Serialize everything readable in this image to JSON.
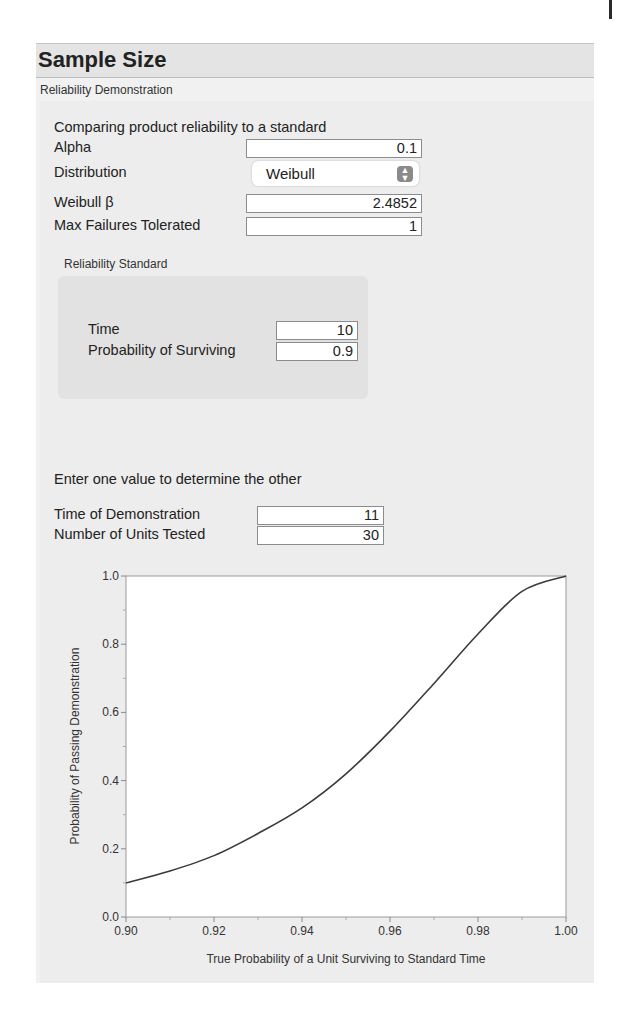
{
  "header": {
    "title": "Sample Size",
    "subtitle": "Reliability Demonstration"
  },
  "form": {
    "section_label": "Comparing product reliability to a standard",
    "alpha": {
      "label": "Alpha",
      "value": "0.1"
    },
    "distribution": {
      "label": "Distribution",
      "value": "Weibull",
      "icon": "updown-chevron-icon"
    },
    "weibull_beta": {
      "label": "Weibull β",
      "value": "2.4852"
    },
    "max_failures": {
      "label": "Max Failures Tolerated",
      "value": "1"
    }
  },
  "standard": {
    "title": "Reliability Standard",
    "time": {
      "label": "Time",
      "value": "10"
    },
    "prob_surviving": {
      "label": "Probability of Surviving",
      "value": "0.9"
    }
  },
  "determine": {
    "label": "Enter one value to determine the other",
    "time_demo": {
      "label": "Time of Demonstration",
      "value": "11"
    },
    "units_tested": {
      "label": "Number of Units Tested",
      "value": "30"
    }
  },
  "chart_data": {
    "type": "line",
    "title": "",
    "xlabel": "True Probability of a Unit Surviving to Standard Time",
    "ylabel": "Probability of Passing Demonstration",
    "xlim": [
      0.9,
      1.0
    ],
    "ylim": [
      0.0,
      1.0
    ],
    "x_ticks": [
      "0.90",
      "0.92",
      "0.94",
      "0.96",
      "0.98",
      "1.00"
    ],
    "y_ticks": [
      "0.0",
      "0.2",
      "0.4",
      "0.6",
      "0.8",
      "1.0"
    ],
    "grid": false,
    "legend": null,
    "series": [
      {
        "name": "Probability of Passing",
        "x": [
          0.9,
          0.91,
          0.92,
          0.93,
          0.94,
          0.95,
          0.96,
          0.97,
          0.98,
          0.99,
          1.0
        ],
        "values": [
          0.1,
          0.135,
          0.18,
          0.245,
          0.32,
          0.42,
          0.545,
          0.685,
          0.83,
          0.955,
          1.0
        ]
      }
    ]
  }
}
